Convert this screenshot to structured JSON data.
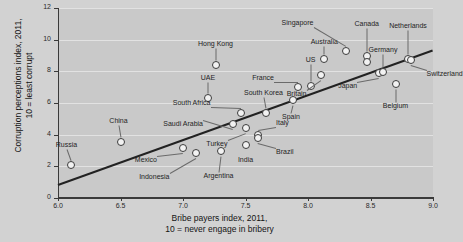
{
  "chart_data": {
    "type": "scatter",
    "title": "",
    "xlabel": "Bribe payers index, 2011,\n10 = never engage in bribery",
    "xlabel_line1": "Bribe payers index, 2011,",
    "xlabel_line2": "10 = never engage in bribery",
    "ylabel_line1": "Corruption perceptions index, 2011,",
    "ylabel_line2": "10 = least corrupt",
    "xlim": [
      6.0,
      9.0
    ],
    "ylim": [
      0,
      12
    ],
    "xticks": [
      "6.0",
      "6.5",
      "7.0",
      "7.5",
      "8.0",
      "8.5",
      "9.0"
    ],
    "xtick_values": [
      6.0,
      6.5,
      7.0,
      7.5,
      8.0,
      8.5,
      9.0
    ],
    "yticks": [
      "0",
      "2",
      "4",
      "6",
      "8",
      "10",
      "12"
    ],
    "ytick_values": [
      0,
      2,
      4,
      6,
      8,
      10,
      12
    ],
    "grid": true,
    "legend": "none",
    "trendline": {
      "x0": 6.0,
      "y0": 0.9,
      "x1": 9.0,
      "y1": 9.4
    },
    "points": [
      {
        "name": "Russia",
        "x": 6.1,
        "y": 2.1,
        "label_dx": -4,
        "label_dy": -20,
        "anchor": "center"
      },
      {
        "name": "China",
        "x": 6.5,
        "y": 3.55,
        "label_dx": -2,
        "label_dy": -21,
        "anchor": "center"
      },
      {
        "name": "Mexico",
        "x": 7.0,
        "y": 3.15,
        "label_dx": -26,
        "label_dy": 12,
        "anchor": "end"
      },
      {
        "name": "Indonesia",
        "x": 7.1,
        "y": 2.85,
        "label_dx": -26,
        "label_dy": 24,
        "anchor": "end"
      },
      {
        "name": "Argentina",
        "x": 7.3,
        "y": 2.95,
        "label_dx": -2,
        "label_dy": 25,
        "anchor": "center"
      },
      {
        "name": "UAE",
        "x": 7.2,
        "y": 6.3,
        "label_dx": 0,
        "label_dy": -20,
        "anchor": "center"
      },
      {
        "name": "Hong Kong",
        "x": 7.26,
        "y": 8.4,
        "label_dx": 0,
        "label_dy": -21,
        "anchor": "center"
      },
      {
        "name": "Saudi Arabia",
        "x": 7.4,
        "y": 4.7,
        "label_dx": -30,
        "label_dy": 0,
        "anchor": "end"
      },
      {
        "name": "South Africa",
        "x": 7.46,
        "y": 5.4,
        "label_dx": -30,
        "label_dy": -10,
        "anchor": "end"
      },
      {
        "name": "Turkey",
        "x": 7.5,
        "y": 4.45,
        "label_dx": -18,
        "label_dy": 16,
        "anchor": "end"
      },
      {
        "name": "India",
        "x": 7.5,
        "y": 3.35,
        "label_dx": 0,
        "label_dy": 15,
        "anchor": "center"
      },
      {
        "name": "Italy",
        "x": 7.6,
        "y": 4.0,
        "label_dx": 18,
        "label_dy": -12,
        "anchor": "start"
      },
      {
        "name": "Brazil",
        "x": 7.6,
        "y": 3.8,
        "label_dx": 18,
        "label_dy": 14,
        "anchor": "start"
      },
      {
        "name": "South Korea",
        "x": 7.66,
        "y": 5.4,
        "label_dx": -2,
        "label_dy": -20,
        "anchor": "center"
      },
      {
        "name": "Spain",
        "x": 7.88,
        "y": 6.2,
        "label_dx": -2,
        "label_dy": 17,
        "anchor": "center"
      },
      {
        "name": "France",
        "x": 7.92,
        "y": 7.0,
        "label_dx": -24,
        "label_dy": -9,
        "anchor": "end"
      },
      {
        "name": "US",
        "x": 8.02,
        "y": 7.1,
        "label_dx": 0,
        "label_dy": -26,
        "anchor": "center"
      },
      {
        "name": "Britain",
        "x": 8.1,
        "y": 7.8,
        "label_dx": -14,
        "label_dy": 19,
        "anchor": "end"
      },
      {
        "name": "Australia",
        "x": 8.13,
        "y": 8.8,
        "label_dx": 0,
        "label_dy": -17,
        "anchor": "center"
      },
      {
        "name": "Singapore",
        "x": 8.3,
        "y": 9.3,
        "label_dx": -32,
        "label_dy": -28,
        "anchor": "end"
      },
      {
        "name": "Canada",
        "x": 8.47,
        "y": 8.95,
        "label_dx": 0,
        "label_dy": -32,
        "anchor": "center"
      },
      {
        "name": "Canada2",
        "x": 8.47,
        "y": 8.6,
        "label_dx": 0,
        "label_dy": 0,
        "anchor": "none"
      },
      {
        "name": "Japan",
        "x": 8.57,
        "y": 7.9,
        "label_dx": -22,
        "label_dy": 13,
        "anchor": "end"
      },
      {
        "name": "Germany",
        "x": 8.6,
        "y": 7.95,
        "label_dx": 0,
        "label_dy": -22,
        "anchor": "center"
      },
      {
        "name": "Belgium",
        "x": 8.7,
        "y": 7.2,
        "label_dx": 0,
        "label_dy": 22,
        "anchor": "center"
      },
      {
        "name": "Netherlands",
        "x": 8.8,
        "y": 8.8,
        "label_dx": 0,
        "label_dy": -33,
        "anchor": "center"
      },
      {
        "name": "Switzerland",
        "x": 8.82,
        "y": 8.74,
        "label_dx": 16,
        "label_dy": 14,
        "anchor": "start"
      }
    ]
  },
  "colors": {
    "page_background": "#d2d2d2",
    "plot_background": "#c9c9c9",
    "gridline": "#e2e2e2",
    "axis": "#3a3a3a",
    "point_fill": "#f2f2f2",
    "point_stroke": "#3b3b3b",
    "trendline": "#222222",
    "text": "#1a1a1a"
  }
}
